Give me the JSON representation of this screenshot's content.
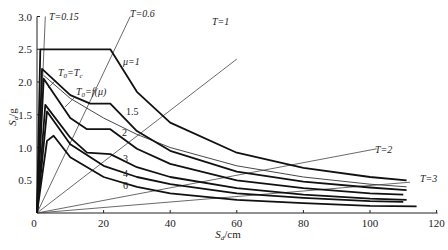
{
  "chart_data": {
    "type": "line",
    "title": "",
    "xlabel": "S_d/cm",
    "ylabel": "S_a/g",
    "xlim": [
      0,
      120
    ],
    "ylim": [
      0,
      3.0
    ],
    "x_ticks": [
      "0",
      "20",
      "40",
      "60",
      "80",
      "100",
      "120"
    ],
    "y_ticks": [
      "0.5",
      "1.0",
      "1.5",
      "2.0",
      "2.5",
      "3.0"
    ],
    "grid": false,
    "legend": "none (inline labels)",
    "demand_curves": [
      {
        "name": "μ=1",
        "label": "μ=1",
        "points": [
          [
            0,
            0
          ],
          [
            1,
            2.5
          ],
          [
            22,
            2.5
          ],
          [
            30,
            1.85
          ],
          [
            40,
            1.38
          ],
          [
            60,
            0.92
          ],
          [
            80,
            0.69
          ],
          [
            100,
            0.55
          ],
          [
            111,
            0.5
          ]
        ]
      },
      {
        "name": "μ=1.5",
        "label": "1.5",
        "points": [
          [
            0,
            0
          ],
          [
            1.5,
            2.2
          ],
          [
            10,
            1.8
          ],
          [
            16,
            1.67
          ],
          [
            22,
            1.67
          ],
          [
            30,
            1.25
          ],
          [
            40,
            0.95
          ],
          [
            60,
            0.63
          ],
          [
            80,
            0.48
          ],
          [
            100,
            0.39
          ],
          [
            111,
            0.35
          ]
        ]
      },
      {
        "name": "μ=2",
        "label": "2",
        "points": [
          [
            0,
            0
          ],
          [
            2,
            2.05
          ],
          [
            10,
            1.45
          ],
          [
            15,
            1.28
          ],
          [
            22,
            1.28
          ],
          [
            30,
            0.98
          ],
          [
            40,
            0.75
          ],
          [
            60,
            0.5
          ],
          [
            80,
            0.38
          ],
          [
            100,
            0.3
          ],
          [
            110,
            0.28
          ]
        ]
      },
      {
        "name": "μ=3",
        "label": "3",
        "points": [
          [
            0,
            0
          ],
          [
            2.5,
            1.65
          ],
          [
            10,
            1.15
          ],
          [
            15,
            0.92
          ],
          [
            22,
            0.9
          ],
          [
            30,
            0.7
          ],
          [
            40,
            0.55
          ],
          [
            60,
            0.38
          ],
          [
            80,
            0.28
          ],
          [
            100,
            0.22
          ],
          [
            111,
            0.2
          ]
        ]
      },
      {
        "name": "μ=4",
        "label": "4",
        "points": [
          [
            0,
            0
          ],
          [
            3,
            1.55
          ],
          [
            10,
            1.05
          ],
          [
            20,
            0.72
          ],
          [
            30,
            0.55
          ],
          [
            40,
            0.44
          ],
          [
            60,
            0.3
          ],
          [
            80,
            0.23
          ],
          [
            100,
            0.18
          ],
          [
            110,
            0.17
          ]
        ]
      },
      {
        "name": "μ=6",
        "label": "6",
        "points": [
          [
            0,
            0
          ],
          [
            3,
            1.1
          ],
          [
            5,
            1.18
          ],
          [
            10,
            0.85
          ],
          [
            20,
            0.55
          ],
          [
            30,
            0.4
          ],
          [
            40,
            0.3
          ],
          [
            60,
            0.2
          ],
          [
            80,
            0.15
          ],
          [
            100,
            0.11
          ],
          [
            114,
            0.1
          ]
        ]
      }
    ],
    "reference_curve": {
      "name": "T0=f(μ)",
      "label": "T_0=f(μ)",
      "points": [
        [
          2,
          2.1
        ],
        [
          10,
          1.75
        ],
        [
          20,
          1.45
        ],
        [
          30,
          1.2
        ],
        [
          40,
          1.0
        ],
        [
          60,
          0.72
        ],
        [
          80,
          0.55
        ],
        [
          100,
          0.44
        ],
        [
          111,
          0.4
        ]
      ]
    },
    "period_lines": [
      {
        "label": "T=0.15",
        "end": [
          2.5,
          3.0
        ]
      },
      {
        "label": "T=0.6",
        "end": [
          28,
          3.0
        ]
      },
      {
        "label": "T=1",
        "end": [
          60,
          2.35
        ]
      },
      {
        "label": "T=2",
        "end": [
          102,
          0.98
        ]
      },
      {
        "label": "T=3",
        "end": [
          112,
          0.47
        ]
      }
    ],
    "annotations": [
      "T=0.15",
      "T=0.6",
      "T=1",
      "T=2",
      "T=3",
      "T_0=T_c",
      "T_0=f(μ)",
      "μ=1",
      "1.5",
      "2",
      "3",
      "4",
      "6"
    ]
  },
  "axis": {
    "x_label_main": "S",
    "x_label_sub": "d",
    "x_label_unit": "/cm",
    "y_label_main": "S",
    "y_label_sub": "a",
    "y_label_unit": "/g",
    "origin_label": "0"
  }
}
